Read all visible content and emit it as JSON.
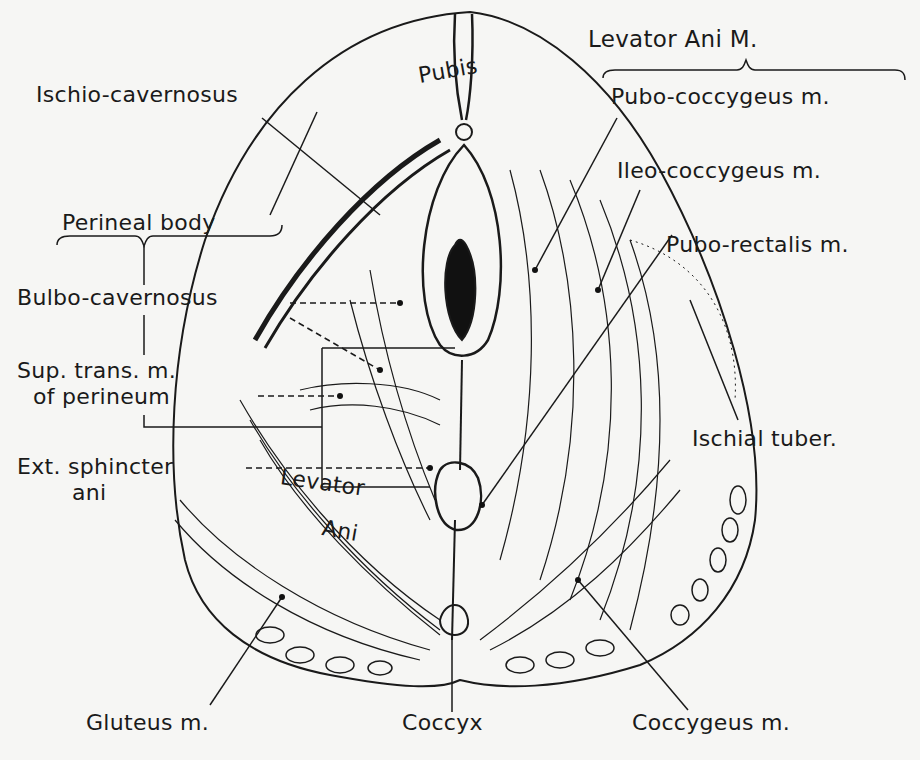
{
  "figure": {
    "labels": {
      "pubis": "Pubis",
      "ischio_cavernosus": "Ischio-cavernosus",
      "perineal_body": "Perineal body",
      "bulbo_cavernosus": "Bulbo-cavernosus",
      "sup_trans_line1": "Sup. trans. m.",
      "sup_trans_line2": "of perineum",
      "ext_sphincter_line1": "Ext. sphincter",
      "ext_sphincter_line2": "ani",
      "levator_ani_inner_line1": "Levator",
      "levator_ani_inner_line2": "Ani",
      "levator_ani_group": "Levator Ani M.",
      "pubo_coccygeus": "Pubo-coccygeus m.",
      "ileo_coccygeus": "Ileo-coccygeus m.",
      "pubo_rectalis": "Pubo-rectalis m.",
      "ischial_tuber": "Ischial tuber.",
      "gluteus": "Gluteus m.",
      "coccyx": "Coccyx",
      "coccygeus": "Coccygeus m."
    },
    "colors": {
      "ink": "#1a1a1a",
      "paper": "#f6f6f4"
    }
  }
}
